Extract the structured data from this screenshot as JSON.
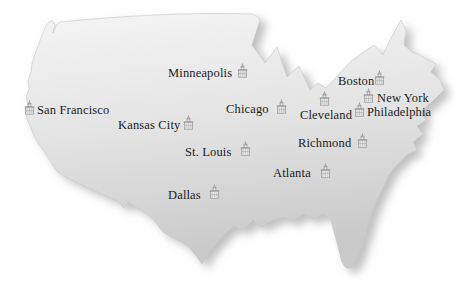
{
  "colors": {
    "map-light": "#f5f5f5",
    "map-mid": "#e3e3e3",
    "map-dark": "#c9c9c9",
    "map-edge": "#c6c6c6",
    "shadow": "#8c8c8c",
    "label-text": "#1c1c1c",
    "icon-stroke": "#8a8a8a",
    "icon-fill": "#e8e8e8",
    "background": "#ffffff"
  },
  "map": {
    "country": "United States",
    "marker_icon": "bank-building-icon",
    "cities": [
      {
        "name": "San Francisco",
        "label": {
          "x": 37,
          "y": 103
        },
        "icon": {
          "x": 24,
          "y": 100
        }
      },
      {
        "name": "Minneapolis",
        "label": {
          "x": 168,
          "y": 66
        },
        "icon": {
          "x": 237,
          "y": 63
        }
      },
      {
        "name": "Kansas City",
        "label": {
          "x": 118,
          "y": 118
        },
        "icon": {
          "x": 183,
          "y": 115
        }
      },
      {
        "name": "St. Louis",
        "label": {
          "x": 185,
          "y": 145
        },
        "icon": {
          "x": 240,
          "y": 141
        }
      },
      {
        "name": "Dallas",
        "label": {
          "x": 168,
          "y": 188
        },
        "icon": {
          "x": 209,
          "y": 184
        }
      },
      {
        "name": "Chicago",
        "label": {
          "x": 226,
          "y": 102
        },
        "icon": {
          "x": 276,
          "y": 99
        }
      },
      {
        "name": "Cleveland",
        "label": {
          "x": 300,
          "y": 108
        },
        "icon": {
          "x": 319,
          "y": 91
        }
      },
      {
        "name": "Richmond",
        "label": {
          "x": 298,
          "y": 136
        },
        "icon": {
          "x": 357,
          "y": 133
        }
      },
      {
        "name": "Atlanta",
        "label": {
          "x": 273,
          "y": 166
        },
        "icon": {
          "x": 320,
          "y": 163
        }
      },
      {
        "name": "Boston",
        "label": {
          "x": 338,
          "y": 74
        },
        "icon": {
          "x": 374,
          "y": 70
        }
      },
      {
        "name": "New York",
        "label": {
          "x": 377,
          "y": 91
        },
        "icon": {
          "x": 363,
          "y": 88
        }
      },
      {
        "name": "Philadelphia",
        "label": {
          "x": 367,
          "y": 105
        },
        "icon": {
          "x": 354,
          "y": 102
        }
      }
    ]
  }
}
